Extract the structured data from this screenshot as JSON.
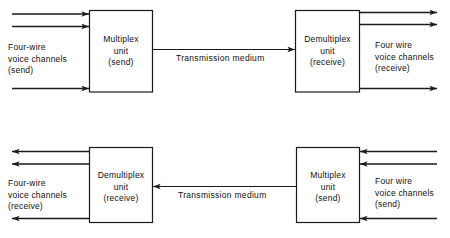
{
  "diagram": {
    "line_color": "#1a1a1a",
    "box_fill": "#ffffff",
    "background": "#ffffff",
    "top_row": {
      "left_group_label": {
        "line1": "Four-wire",
        "line2": "voice channels",
        "line3": "(send)"
      },
      "left_box": {
        "line1": "Multiplex",
        "line2": "unit",
        "line3": "(send)"
      },
      "medium_label": "Transmission medium",
      "right_box": {
        "line1": "Demultiplex",
        "line2": "unit",
        "line3": "(receive)"
      },
      "right_group_label": {
        "line1": "Four wire",
        "line2": "voice channels",
        "line3": "(receive)"
      }
    },
    "bottom_row": {
      "left_group_label": {
        "line1": "Four-wire",
        "line2": "voice channels",
        "line3": "(receive)"
      },
      "left_box": {
        "line1": "Demultiplex",
        "line2": "unit",
        "line3": "(receive)"
      },
      "medium_label": "Transmission medium",
      "right_box": {
        "line1": "Multiplex",
        "line2": "unit",
        "line3": "(send)"
      },
      "right_group_label": {
        "line1": "Four wire",
        "line2": "voice channels",
        "line3": "(send)"
      }
    }
  }
}
